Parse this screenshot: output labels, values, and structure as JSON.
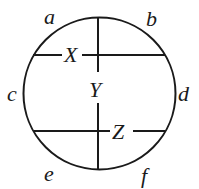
{
  "diagram": {
    "type": "circle-with-chords",
    "circle": {
      "cx": 99.5,
      "cy": 93.5,
      "r": 76
    },
    "stroke_color": "#1a1a1a",
    "background": "#ffffff",
    "arc_labels": {
      "a": "a",
      "b": "b",
      "c": "c",
      "d": "d",
      "e": "e",
      "f": "f"
    },
    "segment_labels": {
      "X": "X",
      "Y": "Y",
      "Z": "Z"
    }
  }
}
